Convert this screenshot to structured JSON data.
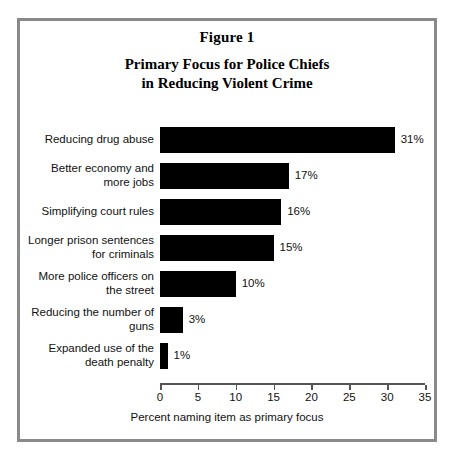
{
  "figure": {
    "number_label": "Figure 1",
    "title_line1": "Primary Focus for Police Chiefs",
    "title_line2": "in Reducing Violent Crime"
  },
  "chart_data": {
    "type": "bar",
    "orientation": "horizontal",
    "title": "Primary Focus for Police Chiefs in Reducing Violent Crime",
    "subtitle": "Figure 1",
    "xlabel": "Percent naming item as primary focus",
    "ylabel": "",
    "xlim": [
      0,
      35
    ],
    "xticks": [
      0,
      5,
      10,
      15,
      20,
      25,
      30,
      35
    ],
    "xtick_labels": [
      "0",
      "5",
      "10",
      "15",
      "20",
      "25",
      "30",
      "35"
    ],
    "grid": false,
    "legend": false,
    "bar_color": "#000000",
    "categories": [
      "Reducing drug abuse",
      "Better economy and\nmore jobs",
      "Simplifying court rules",
      "Longer prison sentences\nfor criminals",
      "More police officers on\nthe street",
      "Reducing the number of\nguns",
      "Expanded use of the\ndeath penalty"
    ],
    "values": [
      31,
      17,
      16,
      15,
      10,
      3,
      1
    ],
    "value_labels": [
      "31%",
      "17%",
      "16%",
      "15%",
      "10%",
      "3%",
      "1%"
    ]
  }
}
